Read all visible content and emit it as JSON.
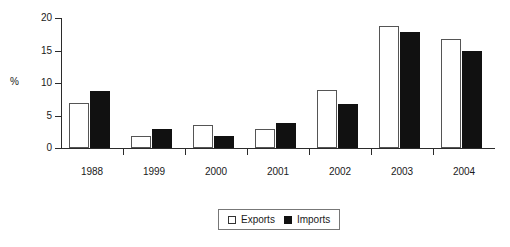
{
  "chart_data": {
    "type": "bar",
    "title": "",
    "subtitle": "",
    "xlabel": "",
    "ylabel": "%",
    "ylim": [
      0,
      20
    ],
    "yticks": [
      0,
      5,
      10,
      15,
      20
    ],
    "ytick_labels": [
      "0",
      "5",
      "10",
      "15",
      "20"
    ],
    "grid": false,
    "legend_position": "bottom-center",
    "categories": [
      "1988",
      "1999",
      "2000",
      "2001",
      "2002",
      "2003",
      "2004"
    ],
    "series": [
      {
        "name": "Exports",
        "color": "#ffffff",
        "edge_color": "#555555",
        "values": [
          7.0,
          1.9,
          3.6,
          3.0,
          8.9,
          18.8,
          16.7
        ]
      },
      {
        "name": "Imports",
        "color": "#111111",
        "edge_color": "#111111",
        "values": [
          8.8,
          2.9,
          1.9,
          3.9,
          6.8,
          17.9,
          14.9
        ]
      }
    ]
  },
  "legend": {
    "entries": [
      {
        "label": "Exports",
        "swatch": "white-square-icon"
      },
      {
        "label": "Imports",
        "swatch": "black-square-icon"
      }
    ]
  }
}
